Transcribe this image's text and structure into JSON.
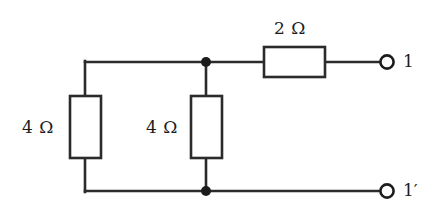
{
  "figure": {
    "name": "resistive-two-terminal-network",
    "type": "circuit-schematic",
    "background_color": "#ffffff",
    "line_color": "#2b2b2b",
    "text_color": "#1c1c1c"
  },
  "components": {
    "series_resistor": {
      "id": "r2",
      "label": "2 Ω",
      "value": 2,
      "unit": "Ω",
      "orientation": "horizontal",
      "box": {
        "x": 264,
        "y": 47,
        "w": 61,
        "h": 30
      }
    },
    "left_resistor": {
      "id": "r4-left",
      "label": "4 Ω",
      "value": 4,
      "unit": "Ω",
      "orientation": "vertical",
      "box": {
        "x": 70,
        "y": 96,
        "w": 31,
        "h": 62
      }
    },
    "middle_resistor": {
      "id": "r4-mid",
      "label": "4 Ω",
      "value": 4,
      "unit": "Ω",
      "orientation": "vertical",
      "box": {
        "x": 191,
        "y": 96,
        "w": 31,
        "h": 62
      }
    }
  },
  "terminals": {
    "top": {
      "label": "1",
      "circle": {
        "cx": 387,
        "cy": 62,
        "r": 7
      }
    },
    "bottom": {
      "label": "1",
      "prime": "′",
      "circle": {
        "cx": 387,
        "cy": 191,
        "r": 7
      }
    }
  },
  "junctions": [
    {
      "name": "top-node",
      "cx": 206,
      "cy": 62,
      "r": 5
    },
    {
      "name": "bottom-node",
      "cx": 206,
      "cy": 191,
      "r": 5
    }
  ],
  "wires": [
    {
      "name": "top-left-horizontal",
      "x1": 85,
      "y1": 62,
      "x2": 206,
      "y2": 62
    },
    {
      "name": "left-branch-top-vertical",
      "x1": 85,
      "y1": 62,
      "x2": 85,
      "y2": 96
    },
    {
      "name": "left-branch-bottom-vertical",
      "x1": 85,
      "y1": 158,
      "x2": 85,
      "y2": 191
    },
    {
      "name": "bottom-left-horizontal",
      "x1": 85,
      "y1": 191,
      "x2": 206,
      "y2": 191
    },
    {
      "name": "middle-branch-top-vertical",
      "x1": 206,
      "y1": 62,
      "x2": 206,
      "y2": 96
    },
    {
      "name": "middle-branch-bottom-vertical",
      "x1": 206,
      "y1": 158,
      "x2": 206,
      "y2": 191
    },
    {
      "name": "node-to-series-resistor",
      "x1": 206,
      "y1": 62,
      "x2": 264,
      "y2": 62
    },
    {
      "name": "series-resistor-to-terminal",
      "x1": 325,
      "y1": 62,
      "x2": 380,
      "y2": 62
    },
    {
      "name": "bottom-node-to-terminal",
      "x1": 206,
      "y1": 191,
      "x2": 380,
      "y2": 191
    }
  ]
}
